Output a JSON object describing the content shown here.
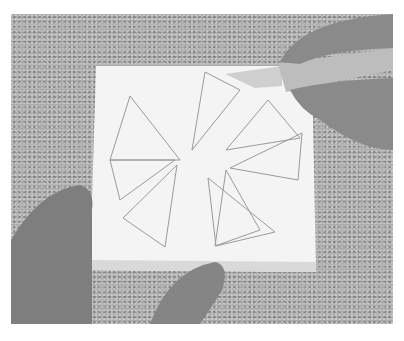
{
  "scene": {
    "description": "Grayscale photo of hands holding a white foam block with pencil-drawn pinwheel triangles while a craft knife cuts along a line",
    "colors": {
      "background_surface": "#a9a9a9",
      "foam_block": "#f4f4f4",
      "foam_edge": "#d9d9d9",
      "pencil_lines": "#9a9a9a",
      "skin": "#8a8a8a",
      "knife_handle": "#bdbdbd"
    },
    "objects": [
      "speckled-surface",
      "foam-block",
      "pinwheel-triangles",
      "craft-knife",
      "left-hand",
      "right-hand",
      "bottom-thumb"
    ]
  }
}
